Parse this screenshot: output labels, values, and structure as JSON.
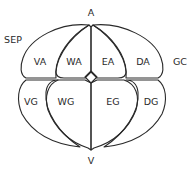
{
  "diagram": {
    "poles": {
      "animal": "A",
      "vegetal": "V"
    },
    "annotations": {
      "left": "SEP",
      "right": "GC"
    },
    "animal_cells": [
      {
        "id": "VA",
        "label": "VA"
      },
      {
        "id": "WA",
        "label": "WA"
      },
      {
        "id": "EA",
        "label": "EA"
      },
      {
        "id": "DA",
        "label": "DA"
      }
    ],
    "vegetal_cells": [
      {
        "id": "VG",
        "label": "VG"
      },
      {
        "id": "WG",
        "label": "WG"
      },
      {
        "id": "EG",
        "label": "EG"
      },
      {
        "id": "DG",
        "label": "DG"
      }
    ],
    "colors": {
      "line": "#2a2a2a",
      "background": "#ffffff"
    }
  }
}
